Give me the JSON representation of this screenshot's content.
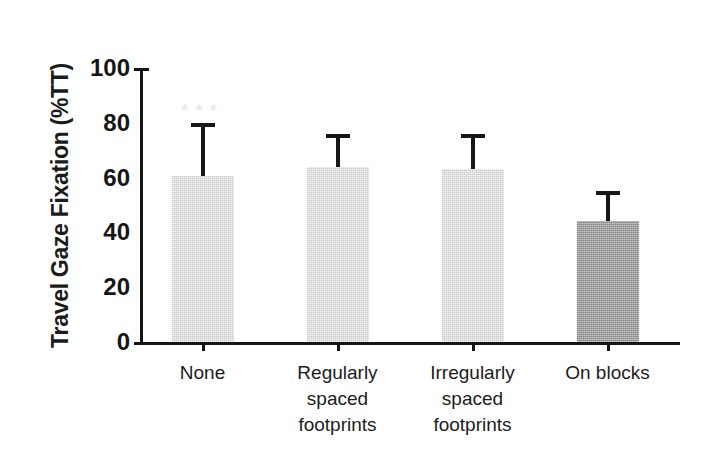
{
  "chart_data": {
    "type": "bar",
    "title": "",
    "subtitle": "",
    "xlabel": "",
    "ylabel": "Travel Gaze Fixation (%TT)",
    "ylim": [
      0,
      100
    ],
    "yticks": [
      0,
      20,
      40,
      60,
      80,
      100
    ],
    "ytick_labels": [
      "0",
      "20",
      "40",
      "60",
      "80",
      "100"
    ],
    "grid": false,
    "legend": null,
    "categories": [
      "None",
      "Regularly spaced footprints",
      "Irregularly spaced footprints",
      "On blocks"
    ],
    "category_label_lines": [
      [
        "None"
      ],
      [
        "Regularly",
        "spaced",
        "footprints"
      ],
      [
        "Irregularly",
        "spaced",
        "footprints"
      ],
      [
        "On blocks"
      ]
    ],
    "values": [
      60.5,
      64.0,
      63.0,
      44.0
    ],
    "errors_upper": [
      80.0,
      76.0,
      76.0,
      55.0
    ],
    "bar_colors": [
      "#dddddd",
      "#dddddd",
      "#dddddd",
      "#9d9d9d"
    ],
    "error_color": "#171717",
    "axis_color": "#141414",
    "annotations": [
      {
        "text": "***",
        "category": "None",
        "y": 88
      }
    ]
  }
}
